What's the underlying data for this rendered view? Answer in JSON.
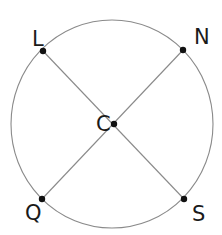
{
  "figure": {
    "type": "geometry-diagram",
    "canvas": {
      "width": 222,
      "height": 235,
      "background": "#ffffff"
    },
    "colors": {
      "stroke": "#8a8a8a",
      "point": "#111111",
      "label": "#1a1a1a",
      "background": "#ffffff"
    },
    "circle": {
      "name": "circle-C",
      "center_x": 112,
      "center_y": 124,
      "radius_x": 101,
      "radius_y": 104,
      "stroke_width": 1.1
    },
    "points": [
      {
        "id": "L",
        "label": "L",
        "x": 43,
        "y": 51,
        "label_x": 32,
        "label_y": 46,
        "on_circle": true
      },
      {
        "id": "N",
        "label": "N",
        "x": 183,
        "y": 50,
        "label_x": 194,
        "label_y": 44,
        "on_circle": true
      },
      {
        "id": "C",
        "label": "C",
        "x": 114,
        "y": 124,
        "label_x": 96,
        "label_y": 131,
        "on_circle": false
      },
      {
        "id": "Q",
        "label": "Q",
        "x": 42,
        "y": 199,
        "label_x": 25,
        "label_y": 220,
        "on_circle": true
      },
      {
        "id": "S",
        "label": "S",
        "x": 184,
        "y": 199,
        "label_x": 192,
        "label_y": 221,
        "on_circle": true
      }
    ],
    "chords": [
      {
        "id": "LS",
        "from": "L",
        "to": "S",
        "label": "chord L to S"
      },
      {
        "id": "NQ",
        "from": "N",
        "to": "Q",
        "label": "chord N to Q"
      }
    ],
    "dot_radius": 3.2,
    "label_font_size": 21
  }
}
